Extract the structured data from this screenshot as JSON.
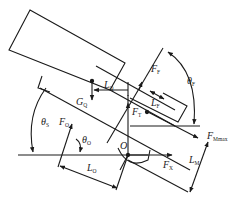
{
  "diagram": {
    "type": "mechanical force/moment diagram",
    "line_color": "#1a1a1a",
    "background": "#ffffff",
    "labels": {
      "L_Q": {
        "main": "L",
        "sub": "Q"
      },
      "F_F": {
        "main": "F",
        "sub": "F"
      },
      "theta_F": {
        "main": "θ",
        "sub": "F"
      },
      "L_F": {
        "main": "L",
        "sub": "F"
      },
      "G_Q": {
        "main": "G",
        "sub": "Q"
      },
      "F_T": {
        "main": "F",
        "sub": "T"
      },
      "theta_S": {
        "main": "θ",
        "sub": "S"
      },
      "F_O": {
        "main": "F",
        "sub": "O"
      },
      "theta_O": {
        "main": "θ",
        "sub": "O"
      },
      "F_Mmax": {
        "main": "F",
        "sub": "Mmax"
      },
      "O": {
        "main": "O",
        "sub": ""
      },
      "F_X": {
        "main": "F",
        "sub": "X"
      },
      "L_M": {
        "main": "L",
        "sub": "M"
      },
      "L_O": {
        "main": "L",
        "sub": "O"
      }
    }
  }
}
